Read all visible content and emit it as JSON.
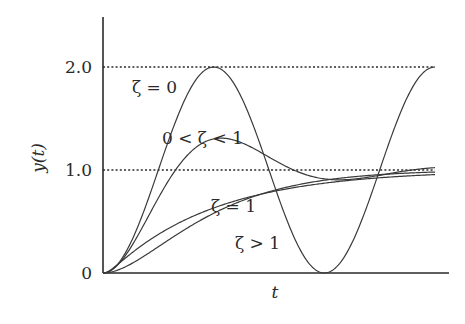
{
  "chart_data": {
    "type": "line",
    "title": "",
    "xlabel": "t",
    "ylabel": "y(t)",
    "ylim": [
      0,
      2.4
    ],
    "xlim": [
      0,
      9.42
    ],
    "yticks": [
      {
        "value": 0,
        "label": "0"
      },
      {
        "value": 1.0,
        "label": "1.0"
      },
      {
        "value": 2.0,
        "label": "2.0"
      }
    ],
    "reference_lines": [
      {
        "y": 1.0,
        "style": "dotted"
      },
      {
        "y": 2.0,
        "style": "dotted"
      }
    ],
    "grid": false,
    "legend": "inline labels",
    "series": [
      {
        "name": "ζ = 0",
        "zeta": 0.0,
        "description": "undamped: oscillates between 0 and 2.0",
        "x": [
          0,
          1.57,
          3.14,
          4.71,
          6.28,
          7.85,
          9.42
        ],
        "values": [
          0,
          1.0,
          2.0,
          1.0,
          0,
          1.0,
          2.0
        ]
      },
      {
        "name": "0 < ζ < 1",
        "zeta": 0.35,
        "description": "underdamped: overshoot ~1.25 then settles near 1.0",
        "x": [
          0,
          1.57,
          3.14,
          4.71,
          6.28,
          7.85,
          9.42
        ],
        "values": [
          0,
          0.75,
          1.25,
          1.07,
          0.88,
          0.95,
          1.0
        ]
      },
      {
        "name": "ζ = 1",
        "zeta": 1.0,
        "description": "critically damped: rises monotonically to 1.0",
        "x": [
          0,
          1.57,
          3.14,
          4.71,
          6.28,
          7.85,
          9.42
        ],
        "values": [
          0,
          0.2,
          0.55,
          0.85,
          0.95,
          0.99,
          1.0
        ]
      },
      {
        "name": "ζ > 1",
        "zeta": 2.2,
        "description": "overdamped: slow rise, crosses 1.0 near the end",
        "x": [
          0,
          1.57,
          3.14,
          4.71,
          6.28,
          7.85,
          9.42
        ],
        "values": [
          0,
          0.1,
          0.35,
          0.62,
          0.85,
          0.98,
          1.06
        ]
      }
    ],
    "annotations": [
      {
        "text": "ζ = 0",
        "near": "peak of undamped curve, left side"
      },
      {
        "text": "0 < ζ < 1",
        "near": "above underdamped peak"
      },
      {
        "text": "ζ = 1",
        "near": "critically damped curve"
      },
      {
        "text": "ζ > 1",
        "near": "overdamped curve"
      }
    ]
  },
  "labels": {
    "y_tick_0": "0",
    "y_tick_1": "1.0",
    "y_tick_2": "2.0",
    "x_axis": "t",
    "y_axis": "y(t)",
    "zeta0": "ζ = 0",
    "under": "0 < ζ < 1",
    "crit": "ζ = 1",
    "over": "ζ > 1"
  }
}
